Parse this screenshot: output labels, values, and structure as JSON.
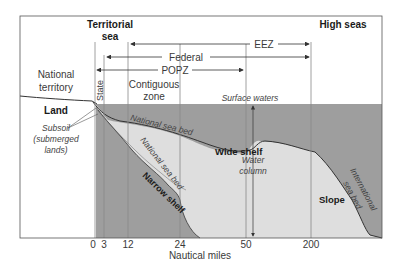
{
  "diagram": {
    "type": "cross-section",
    "headers": {
      "territorial_sea": [
        "Territorial",
        "sea"
      ],
      "high_seas": "High seas"
    },
    "zones": {
      "eez": "EEZ",
      "federal": "Federal",
      "popz": "POPZ",
      "state": "State",
      "contiguous": [
        "Contiguous",
        "zone"
      ]
    },
    "regions": {
      "national_territory": [
        "National",
        "territory"
      ],
      "land": "Land",
      "subsoil": [
        "Subsoil",
        "(submerged",
        "lands)"
      ],
      "surface_waters": "Surface waters",
      "national_sea_bed_1": "National sea bed",
      "national_sea_bed_2": "National sea bed",
      "wide_shelf": "Wide shelf",
      "narrow_shelf": "Narrow shelf",
      "water_column": [
        "Water",
        "column"
      ],
      "slope": "Slope",
      "international_sea_bed": [
        "International",
        "sea bed"
      ]
    },
    "axis": {
      "label": "Nautical miles",
      "ticks": [
        "0",
        "3",
        "12",
        "24",
        "50",
        "200"
      ]
    },
    "colors": {
      "deep_water": "#9e9e9e",
      "shelf": "#dedede",
      "frame": "#555555",
      "line": "#888888"
    }
  }
}
